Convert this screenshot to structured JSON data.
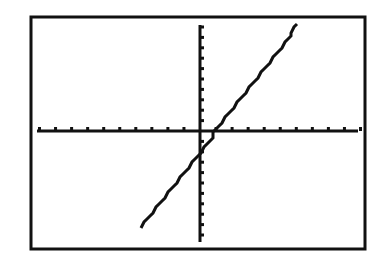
{
  "screen": {
    "frame": {
      "left": 31,
      "top": 17,
      "right": 365,
      "bottom": 249,
      "stroke": 3
    },
    "colors": {
      "background": "#ffffff",
      "ink": "#111111"
    }
  },
  "chart_data": {
    "type": "line",
    "title": "",
    "xlabel": "",
    "ylabel": "",
    "window": {
      "xmin": -10,
      "xmax": 10,
      "xscl": 1,
      "ymin": -10.5,
      "ymax": 10.5,
      "yscl": 1
    },
    "xlim": [
      -10,
      10
    ],
    "ylim": [
      -10.5,
      10.5
    ],
    "grid": false,
    "legend": null,
    "series": [
      {
        "name": "Y1",
        "equation": "y = 2x - 2",
        "slope": 2,
        "intercept": -2,
        "x": [
          -3.6,
          -2,
          0,
          1,
          2,
          4,
          6.25
        ],
        "values": [
          -9.2,
          -6,
          -2,
          0,
          2,
          6,
          10.5
        ]
      }
    ],
    "axis_pixels": {
      "x_axis_y": 131,
      "y_axis_x": 200,
      "x_from": 37,
      "x_to": 358,
      "y_from": 25,
      "y_to": 242,
      "px_per_x": 16.05,
      "px_per_y": 10.4
    }
  }
}
